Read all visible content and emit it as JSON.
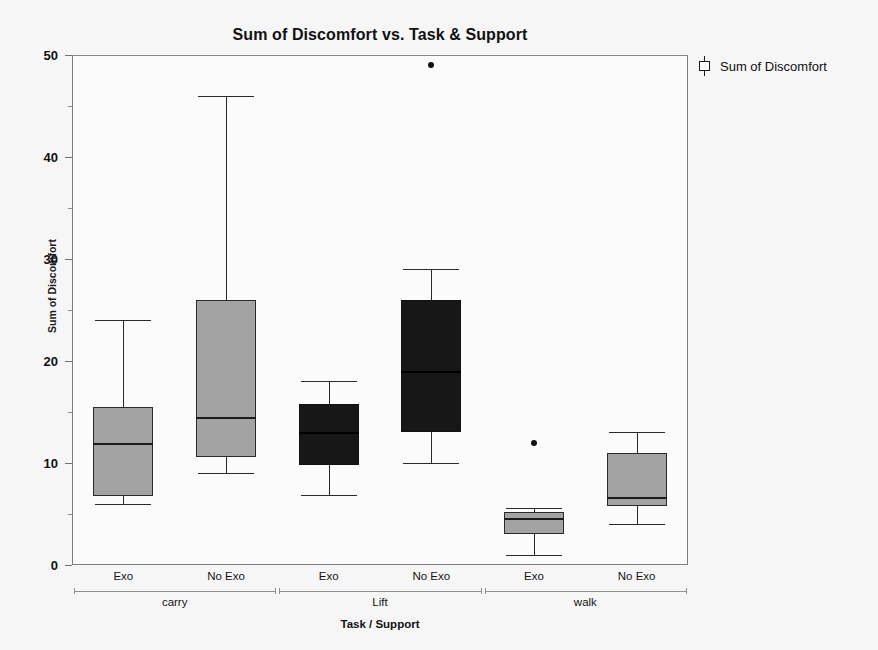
{
  "chart_data": {
    "type": "box",
    "title": "Sum of Discomfort vs. Task & Support",
    "xlabel": "Task / Support",
    "ylabel": "Sum of Discomfort",
    "ylim": [
      0,
      50
    ],
    "y_major_ticks": [
      0,
      10,
      20,
      30,
      40,
      50
    ],
    "y_minor_ticks": [
      5,
      15,
      25,
      35,
      45
    ],
    "grid": false,
    "legend_position": "right",
    "legend": [
      {
        "label": "Sum of Discomfort",
        "glyph": "boxplot-glyph"
      }
    ],
    "group_labels": [
      "carry",
      "Lift",
      "walk"
    ],
    "sub_labels": [
      "Exo",
      "No Exo",
      "Exo",
      "No Exo",
      "Exo",
      "No Exo"
    ],
    "categories": [
      "carry / Exo",
      "carry / No Exo",
      "Lift / Exo",
      "Lift / No Exo",
      "walk / Exo",
      "walk / No Exo"
    ],
    "boxes": [
      {
        "category": "carry / Exo",
        "group": "carry",
        "support": "Exo",
        "fill": "gray",
        "whisker_low": 6.0,
        "q1": 6.8,
        "median": 12.0,
        "q3": 15.5,
        "whisker_high": 24.0,
        "outliers": []
      },
      {
        "category": "carry / No Exo",
        "group": "carry",
        "support": "No Exo",
        "fill": "gray",
        "whisker_low": 9.0,
        "q1": 10.6,
        "median": 14.5,
        "q3": 26.0,
        "whisker_high": 46.0,
        "outliers": []
      },
      {
        "category": "Lift / Exo",
        "group": "Lift",
        "support": "Exo",
        "fill": "dark",
        "whisker_low": 6.9,
        "q1": 9.8,
        "median": 13.0,
        "q3": 15.8,
        "whisker_high": 18.0,
        "outliers": []
      },
      {
        "category": "Lift / No Exo",
        "group": "Lift",
        "support": "No Exo",
        "fill": "dark",
        "whisker_low": 10.0,
        "q1": 13.0,
        "median": 19.0,
        "q3": 26.0,
        "whisker_high": 29.0,
        "outliers": [
          49.0
        ]
      },
      {
        "category": "walk / Exo",
        "group": "walk",
        "support": "Exo",
        "fill": "gray",
        "whisker_low": 1.0,
        "q1": 3.0,
        "median": 4.6,
        "q3": 5.2,
        "whisker_high": 5.6,
        "outliers": [
          12.0
        ]
      },
      {
        "category": "walk / No Exo",
        "group": "walk",
        "support": "No Exo",
        "fill": "gray",
        "whisker_low": 4.0,
        "q1": 5.8,
        "median": 6.7,
        "q3": 11.0,
        "whisker_high": 13.0,
        "outliers": []
      }
    ],
    "colors": {
      "fill_gray": "#a3a3a3",
      "fill_dark": "#171717",
      "line": "#2a2a2a",
      "frame": "#7d7d7d",
      "background": "#f6f6f6",
      "plot_background": "#fbfbfb"
    }
  }
}
